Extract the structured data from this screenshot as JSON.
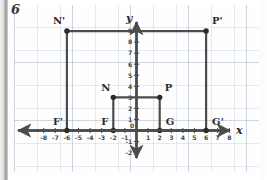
{
  "worksheet": {
    "problem_number": "6"
  },
  "graph": {
    "x_axis_label": "x",
    "y_axis_label": "y",
    "origin_label": "0",
    "x_ticks": [
      "-8",
      "-7",
      "-6",
      "-5",
      "-4",
      "-3",
      "-2",
      "-1",
      "1",
      "2",
      "3",
      "4",
      "5",
      "6",
      "7",
      "8"
    ],
    "y_ticks": [
      "9",
      "8",
      "7",
      "6",
      "5",
      "4",
      "3",
      "2",
      "1",
      "-1",
      "-2"
    ],
    "x_range": [
      -9,
      9
    ],
    "y_range": [
      -2.8,
      10
    ],
    "ink_color": "#4d4d4d",
    "grid_color": "#aab9cd"
  },
  "chart_data": {
    "type": "scatter",
    "title": "",
    "xlabel": "x",
    "ylabel": "y",
    "xlim": [
      -9,
      9
    ],
    "ylim": [
      -2.8,
      10
    ],
    "grid": true,
    "legend": "none",
    "series": [
      {
        "name": "Figure FNPG (pre-image)",
        "closed": true,
        "points": [
          {
            "label": "F",
            "x": -2,
            "y": 0
          },
          {
            "label": "N",
            "x": -2,
            "y": 3
          },
          {
            "label": "P",
            "x": 2,
            "y": 3
          },
          {
            "label": "G",
            "x": 2,
            "y": 0
          }
        ]
      },
      {
        "name": "Figure F'N'P'G' (image)",
        "closed": true,
        "points": [
          {
            "label": "F'",
            "x": -6,
            "y": 0
          },
          {
            "label": "N'",
            "x": -6,
            "y": 9
          },
          {
            "label": "P'",
            "x": 6,
            "y": 9
          },
          {
            "label": "G'",
            "x": 6,
            "y": 0
          }
        ]
      }
    ],
    "point_labels": [
      {
        "text": "N'",
        "x": -6,
        "y": 9,
        "dx": -14,
        "dy": -7
      },
      {
        "text": "P'",
        "x": 6,
        "y": 9,
        "dx": 6,
        "dy": -7
      },
      {
        "text": "N",
        "x": -2,
        "y": 3,
        "dx": -12,
        "dy": -6
      },
      {
        "text": "P",
        "x": 2,
        "y": 3,
        "dx": 5,
        "dy": -6
      },
      {
        "text": "F'",
        "x": -6,
        "y": 0,
        "dx": -14,
        "dy": -6
      },
      {
        "text": "F",
        "x": -2,
        "y": 0,
        "dx": -12,
        "dy": -6
      },
      {
        "text": "G",
        "x": 2,
        "y": 0,
        "dx": 6,
        "dy": -6
      },
      {
        "text": "G'",
        "x": 6,
        "y": 0,
        "dx": 6,
        "dy": -6
      }
    ]
  }
}
